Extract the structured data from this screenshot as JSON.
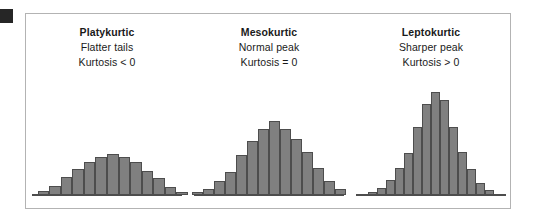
{
  "figure": {
    "background_color": "#ffffff",
    "panel_border_color": "#b3b3b3",
    "bar_fill_color": "#808080",
    "bar_stroke_color": "#4d4d4d",
    "marker_color": "#262626",
    "text_color": "#1a1a1a"
  },
  "columns": [
    {
      "key": "platykurtic",
      "title": "Platykurtic",
      "line1": "Flatter tails",
      "line2": "Kurtosis < 0"
    },
    {
      "key": "mesokurtic",
      "title": "Mesokurtic",
      "line1": "Normal peak",
      "line2": "Kurtosis = 0"
    },
    {
      "key": "leptokurtic",
      "title": "Leptokurtic",
      "line1": "Sharper peak",
      "line2": "Kurtosis > 0"
    }
  ],
  "chart_data": [
    {
      "type": "bar",
      "title": "Platykurtic",
      "subtitle": "Flatter tails",
      "annotation": "Kurtosis < 0",
      "xlabel": "",
      "ylabel": "",
      "grid": false,
      "legend": "none",
      "ylim": [
        0,
        124
      ],
      "bar_width_px": 12,
      "categories": [
        "1",
        "2",
        "3",
        "4",
        "5",
        "6",
        "7",
        "8",
        "9",
        "10",
        "11",
        "12",
        "13",
        "14"
      ],
      "values": [
        0,
        4,
        9,
        18,
        26,
        33,
        38,
        41,
        38,
        33,
        24,
        17,
        8,
        3
      ]
    },
    {
      "type": "bar",
      "title": "Mesokurtic",
      "subtitle": "Normal peak",
      "annotation": "Kurtosis = 0",
      "xlabel": "",
      "ylabel": "",
      "grid": false,
      "legend": "none",
      "ylim": [
        0,
        124
      ],
      "bar_width_px": 11,
      "categories": [
        "1",
        "2",
        "3",
        "4",
        "5",
        "6",
        "7",
        "8",
        "9",
        "10",
        "11",
        "12",
        "13",
        "14"
      ],
      "values": [
        3,
        6,
        14,
        23,
        40,
        54,
        66,
        74,
        66,
        56,
        43,
        27,
        14,
        6
      ]
    },
    {
      "type": "bar",
      "title": "Leptokurtic",
      "subtitle": "Sharper peak",
      "annotation": "Kurtosis > 0",
      "xlabel": "",
      "ylabel": "",
      "grid": false,
      "legend": "none",
      "ylim": [
        0,
        124
      ],
      "bar_width_px": 9,
      "categories": [
        "1",
        "2",
        "3",
        "4",
        "5",
        "6",
        "7",
        "8",
        "9",
        "10",
        "11",
        "12",
        "13",
        "14"
      ],
      "values": [
        3,
        7,
        15,
        27,
        42,
        68,
        91,
        103,
        95,
        68,
        43,
        26,
        12,
        5
      ]
    }
  ]
}
